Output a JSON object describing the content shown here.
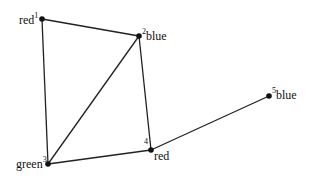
{
  "graph": {
    "nodes": [
      {
        "id": "1",
        "color_label": "red",
        "x": 42,
        "y": 19
      },
      {
        "id": "2",
        "color_label": "blue",
        "x": 139,
        "y": 36
      },
      {
        "id": "3",
        "color_label": "green",
        "x": 48,
        "y": 164
      },
      {
        "id": "4",
        "color_label": "red",
        "x": 151,
        "y": 150
      },
      {
        "id": "5",
        "color_label": "blue",
        "x": 269,
        "y": 96
      }
    ],
    "edges": [
      [
        "1",
        "2"
      ],
      [
        "1",
        "3"
      ],
      [
        "2",
        "3"
      ],
      [
        "2",
        "4"
      ],
      [
        "3",
        "4"
      ],
      [
        "4",
        "5"
      ]
    ]
  }
}
